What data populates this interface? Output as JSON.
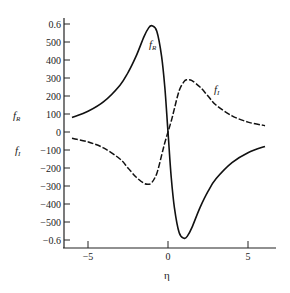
{
  "chart_data": {
    "type": "line",
    "title": "",
    "xlabel": "η",
    "ylabel_upper": "f_R",
    "ylabel_lower": "f_I",
    "xlim": [
      -6,
      6.5
    ],
    "ylim": [
      -650,
      650
    ],
    "x_ticks": [
      -5,
      0,
      5
    ],
    "x_tick_labels": [
      "−5",
      "0",
      "5"
    ],
    "y_ticks": [
      600,
      500,
      400,
      300,
      200,
      100,
      0,
      -100,
      -200,
      -300,
      -400,
      -500,
      -600
    ],
    "y_tick_labels": [
      "0.6",
      "500",
      "400",
      "300",
      "200",
      "100",
      "0",
      "−100",
      "−200",
      "−300",
      "−400",
      "−500",
      "−0.6"
    ],
    "grid": false,
    "legend": "inline curve labels",
    "series": [
      {
        "name": "f_R",
        "style": "solid",
        "x": [
          -6,
          -5,
          -4,
          -3,
          -2.5,
          -2,
          -1.5,
          -1.2,
          -1.0,
          -0.7,
          -0.4,
          -0.2,
          0,
          0.2,
          0.4,
          0.7,
          1.0,
          1.2,
          1.5,
          2,
          2.5,
          3,
          4,
          5,
          6
        ],
        "y": [
          80,
          115,
          170,
          260,
          330,
          420,
          530,
          580,
          590,
          560,
          420,
          250,
          0,
          -250,
          -420,
          -560,
          -590,
          -580,
          -530,
          -420,
          -330,
          -260,
          -170,
          -115,
          -80
        ]
      },
      {
        "name": "f_I",
        "style": "dashed",
        "x": [
          -6,
          -5,
          -4,
          -3,
          -2.5,
          -2,
          -1.5,
          -1.2,
          -1.0,
          -0.7,
          -0.4,
          -0.2,
          0,
          0.2,
          0.4,
          0.7,
          1.0,
          1.2,
          1.5,
          2,
          2.5,
          3,
          4,
          5,
          6
        ],
        "y": [
          -35,
          -55,
          -90,
          -150,
          -200,
          -250,
          -285,
          -290,
          -280,
          -230,
          -130,
          -60,
          0,
          60,
          130,
          230,
          280,
          290,
          285,
          250,
          200,
          150,
          90,
          55,
          35
        ]
      }
    ],
    "annotations": [
      {
        "text": "f_R",
        "x": -1.0,
        "y": 480
      },
      {
        "text": "f_I",
        "x": 3.0,
        "y": 240
      }
    ]
  },
  "labels": {
    "left_upper": "f",
    "left_upper_sub": "R",
    "left_lower": "f",
    "left_lower_sub": "I",
    "curve_r": "f",
    "curve_r_sub": "R",
    "curve_i": "f",
    "curve_i_sub": "I",
    "xlabel": "η"
  }
}
